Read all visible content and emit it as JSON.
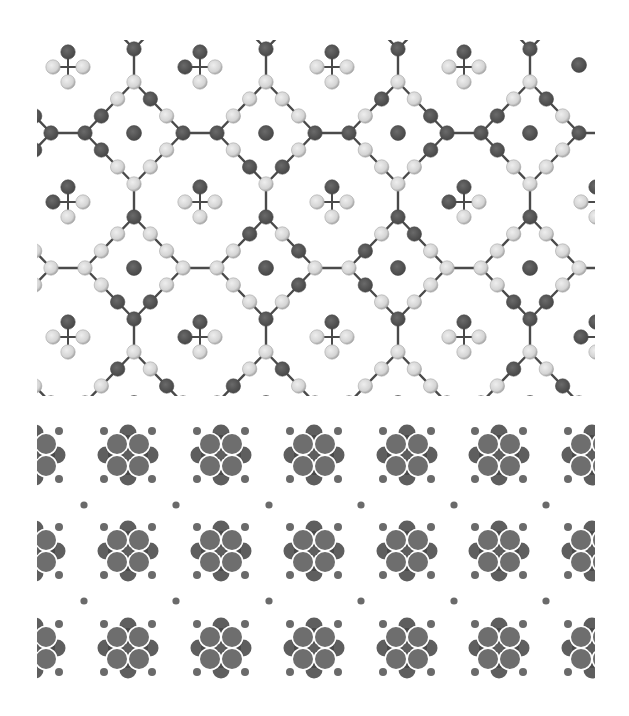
{
  "figure": {
    "colors": {
      "background": "#ffffff",
      "dark_atom": "#585858",
      "dark_atom_edge": "#4a4a4a",
      "light_atom": "#d4d4d4",
      "light_atom_edge": "#a8a8a8",
      "bond": "#4a4a4a",
      "fill_atom": "#5e5e5e",
      "fill_atom_light": "#6e6e6e",
      "small_dot": "#6a6a6a"
    }
  },
  "top_panel": {
    "clip": {
      "x": 37,
      "y": 40,
      "width": 558,
      "height": 356
    },
    "cage": {
      "centers_x": [
        134,
        266,
        398,
        530
      ],
      "rows_y": [
        133,
        268
      ],
      "half_size": 49,
      "bridge_length": 33,
      "stem_length": 34,
      "atom_radius": 7.2,
      "center_dot_radius": 7.5
    },
    "cross_molecules": {
      "positions": [
        [
          68,
          67
        ],
        [
          200,
          67
        ],
        [
          332,
          67
        ],
        [
          464,
          67
        ],
        [
          68,
          202
        ],
        [
          200,
          202
        ],
        [
          332,
          202
        ],
        [
          464,
          202
        ],
        [
          596,
          202
        ],
        [
          68,
          337
        ],
        [
          200,
          337
        ],
        [
          332,
          337
        ],
        [
          464,
          337
        ],
        [
          596,
          337
        ]
      ],
      "arm_length": 15,
      "atom_radius": 7.2
    },
    "isolated_dots": [
      [
        579,
        65
      ]
    ]
  },
  "bottom_panel": {
    "clip": {
      "x": 37,
      "y": 420,
      "width": 558,
      "height": 265
    },
    "clusters": {
      "columns_x": [
        35,
        128,
        221,
        314,
        407,
        499,
        592
      ],
      "rows_y": [
        455,
        551,
        648
      ],
      "inner_radius": 9,
      "petal_radius": 10,
      "tip_radius": 8.5,
      "satellite_radius": 4
    },
    "interstitial_dots": {
      "columns_x": [
        84,
        176,
        269,
        361,
        454,
        546
      ],
      "rows_y": [
        505,
        601
      ],
      "radius": 3.6
    }
  }
}
